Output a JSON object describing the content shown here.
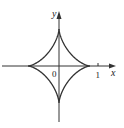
{
  "figure": {
    "type": "astroid",
    "equation": "x^(2/3) + y^(2/3) = 1",
    "axes": {
      "x_label": "x",
      "y_label": "y",
      "origin_label": "0",
      "x_tick_label": "1"
    },
    "colors": {
      "curve": "#333333",
      "axes": "#333333",
      "background": "#ffffff"
    }
  }
}
